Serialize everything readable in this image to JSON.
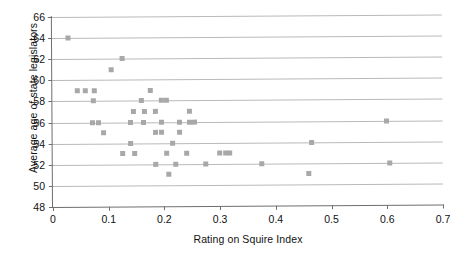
{
  "chart_data": {
    "type": "scatter",
    "title": "",
    "xlabel": "Rating on Squire Index",
    "ylabel": "Average age of state legislators",
    "xlim": [
      0,
      0.7
    ],
    "ylim": [
      48,
      66
    ],
    "xticks": [
      "0",
      "0.1",
      "0.2",
      "0.3",
      "0.4",
      "0.5",
      "0.6",
      "0.7"
    ],
    "xtick_values": [
      0,
      0.1,
      0.2,
      0.3,
      0.4,
      0.5,
      0.6,
      0.7
    ],
    "yticks": [
      "48",
      "50",
      "52",
      "54",
      "56",
      "58",
      "60",
      "62",
      "64",
      "66"
    ],
    "ytick_values": [
      48,
      50,
      52,
      54,
      56,
      58,
      60,
      62,
      64,
      66
    ],
    "grid": "horizontal",
    "legend": "none",
    "marker": "square",
    "marker_color": "#a8a8a8",
    "marker_size_px": 5,
    "points": [
      [
        0.028,
        64
      ],
      [
        0.125,
        62
      ],
      [
        0.105,
        61
      ],
      [
        0.045,
        59
      ],
      [
        0.06,
        59
      ],
      [
        0.075,
        59
      ],
      [
        0.175,
        59
      ],
      [
        0.073,
        58
      ],
      [
        0.16,
        58
      ],
      [
        0.195,
        58
      ],
      [
        0.205,
        58
      ],
      [
        0.145,
        57
      ],
      [
        0.165,
        57
      ],
      [
        0.185,
        57
      ],
      [
        0.245,
        57
      ],
      [
        0.072,
        56
      ],
      [
        0.083,
        56
      ],
      [
        0.14,
        56
      ],
      [
        0.163,
        56
      ],
      [
        0.195,
        56
      ],
      [
        0.228,
        56
      ],
      [
        0.245,
        56
      ],
      [
        0.255,
        56
      ],
      [
        0.6,
        56
      ],
      [
        0.092,
        55
      ],
      [
        0.185,
        55
      ],
      [
        0.196,
        55
      ],
      [
        0.228,
        55
      ],
      [
        0.14,
        54
      ],
      [
        0.215,
        54
      ],
      [
        0.465,
        54
      ],
      [
        0.125,
        53
      ],
      [
        0.148,
        53
      ],
      [
        0.205,
        53
      ],
      [
        0.24,
        53
      ],
      [
        0.3,
        53
      ],
      [
        0.31,
        53
      ],
      [
        0.318,
        53
      ],
      [
        0.185,
        52
      ],
      [
        0.22,
        52
      ],
      [
        0.275,
        52
      ],
      [
        0.375,
        52
      ],
      [
        0.605,
        52
      ],
      [
        0.208,
        51
      ],
      [
        0.46,
        51
      ]
    ]
  }
}
